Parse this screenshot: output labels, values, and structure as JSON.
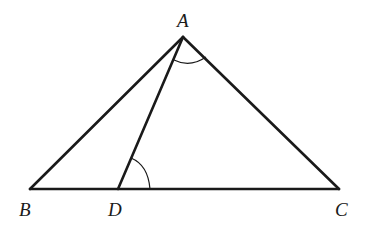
{
  "diagram": {
    "type": "triangle",
    "stroke_color": "#1a1a1a",
    "points": {
      "A": {
        "label": "A",
        "x": 183,
        "y": 37
      },
      "B": {
        "label": "B",
        "x": 30,
        "y": 189
      },
      "C": {
        "label": "C",
        "x": 339,
        "y": 189
      },
      "D": {
        "label": "D",
        "x": 118,
        "y": 189
      }
    },
    "segments": [
      "AB",
      "AC",
      "BC",
      "AD"
    ],
    "marked_angles": [
      "DAC",
      "ADC"
    ]
  }
}
